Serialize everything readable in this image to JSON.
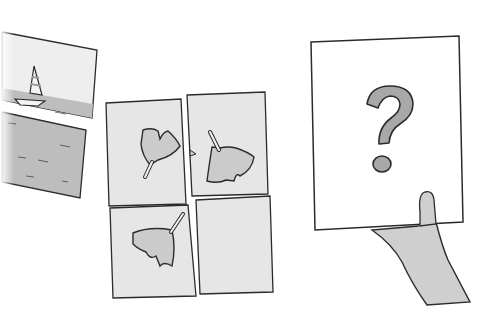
{
  "illustration": {
    "description": "Hand-drawn puzzle illustration: a torn sailboat picture, a 2x2 grid of ginkgo-leaf tiles with one empty slot, and a hand holding up a card with a question mark",
    "colors": {
      "background": "#ffffff",
      "paper": "#ececec",
      "card": "#ffffff",
      "water": "#b9b9b9",
      "stroke": "#2b2b2b",
      "leaf": "#c9c9c9",
      "question_mark": "#a8a8a8",
      "hand": "#cfcfcf"
    },
    "panels": {
      "sailboat": {
        "label": "torn sailboat picture",
        "pieces": 2
      },
      "grid": {
        "label": "ginkgo leaf sequence grid",
        "tiles": [
          {
            "position": "top-left",
            "content": "ginkgo leaf, stem pointing down-left"
          },
          {
            "position": "top-right",
            "content": "ginkgo leaf, stem pointing up-left"
          },
          {
            "position": "bottom-left",
            "content": "ginkgo leaf, stem pointing up-right"
          },
          {
            "position": "bottom-right",
            "content": "empty"
          }
        ]
      },
      "answer_card": {
        "label": "card held by hand",
        "symbol": "?"
      }
    }
  }
}
